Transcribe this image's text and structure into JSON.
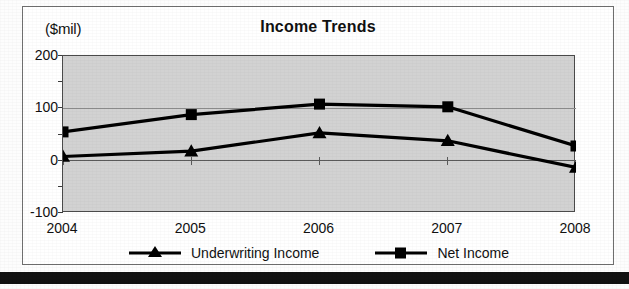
{
  "chart_data": {
    "type": "line",
    "title": "Income Trends",
    "units_label": "($mil)",
    "xlabel": "",
    "ylabel": "",
    "categories": [
      "2004",
      "2005",
      "2006",
      "2007",
      "2008"
    ],
    "ylim": [
      -100,
      200
    ],
    "yticks": [
      -100,
      0,
      100,
      200
    ],
    "ytick_labels": [
      "-100",
      "0",
      "100",
      "200"
    ],
    "yticks_minor": [
      -50,
      50,
      150
    ],
    "grid": true,
    "legend_position": "bottom",
    "series": [
      {
        "name": "Underwriting Income",
        "marker": "triangle",
        "color": "#000000",
        "values": [
          8,
          18,
          53,
          38,
          -13
        ]
      },
      {
        "name": "Net Income",
        "marker": "square",
        "color": "#000000",
        "values": [
          55,
          88,
          108,
          103,
          28
        ]
      }
    ]
  },
  "figure": {
    "plot_background": "#d2d2d2",
    "page_background": "#ffffff",
    "border_color": "#6f6f6f",
    "line_color": "#000000",
    "bottom_bar_color": "#111111"
  }
}
